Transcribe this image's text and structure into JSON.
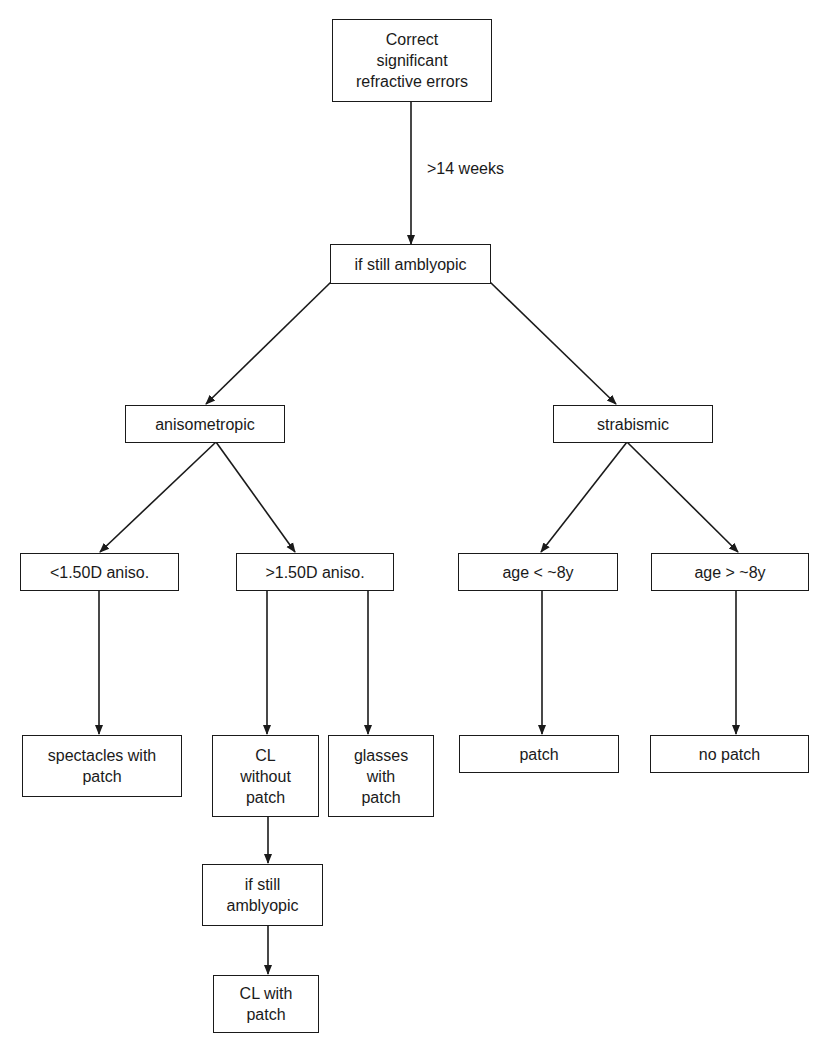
{
  "diagram": {
    "type": "flowchart",
    "direction": "top-to-bottom",
    "colors": {
      "background": "#ffffff",
      "stroke": "#1a1a1a",
      "text": "#1a1a1a"
    },
    "nodes": {
      "correct_errors": {
        "label": "Correct\nsignificant\nrefractive errors"
      },
      "still_amblyopic_1": {
        "label": "if still amblyopic"
      },
      "anisometropic": {
        "label": "anisometropic"
      },
      "strabismic": {
        "label": "strabismic"
      },
      "aniso_lt": {
        "label": "<1.50D aniso."
      },
      "aniso_gt": {
        "label": ">1.50D aniso."
      },
      "age_lt": {
        "label": "age < ~8y"
      },
      "age_gt": {
        "label": "age > ~8y"
      },
      "spectacles_patch": {
        "label": "spectacles with\npatch"
      },
      "cl_without_patch": {
        "label": "CL\nwithout\npatch"
      },
      "glasses_patch": {
        "label": "glasses\nwith\npatch"
      },
      "patch": {
        "label": "patch"
      },
      "no_patch": {
        "label": "no patch"
      },
      "still_amblyopic_2": {
        "label": "if still\namblyopic"
      },
      "cl_with_patch": {
        "label": "CL with\npatch"
      }
    },
    "edges": [
      {
        "from": "correct_errors",
        "to": "still_amblyopic_1",
        "label": ">14 weeks"
      },
      {
        "from": "still_amblyopic_1",
        "to": "anisometropic"
      },
      {
        "from": "still_amblyopic_1",
        "to": "strabismic"
      },
      {
        "from": "anisometropic",
        "to": "aniso_lt"
      },
      {
        "from": "anisometropic",
        "to": "aniso_gt"
      },
      {
        "from": "strabismic",
        "to": "age_lt"
      },
      {
        "from": "strabismic",
        "to": "age_gt"
      },
      {
        "from": "aniso_lt",
        "to": "spectacles_patch"
      },
      {
        "from": "aniso_gt",
        "to": "cl_without_patch"
      },
      {
        "from": "aniso_gt",
        "to": "glasses_patch"
      },
      {
        "from": "age_lt",
        "to": "patch"
      },
      {
        "from": "age_gt",
        "to": "no_patch"
      },
      {
        "from": "cl_without_patch",
        "to": "still_amblyopic_2"
      },
      {
        "from": "still_amblyopic_2",
        "to": "cl_with_patch"
      }
    ],
    "edge_labels": {
      "weeks": ">14 weeks"
    }
  }
}
